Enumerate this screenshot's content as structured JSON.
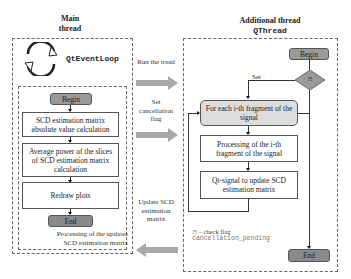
{
  "main_thread": {
    "title_line1": "Main",
    "title_line2": "thread",
    "event_loop_label": "QtEventLoop",
    "begin": "Begin",
    "step1": "SCD estimation matrix absolute value calculation",
    "step2": "Average power of the slices of SCD estimation matrix calculation",
    "step3": "Redraw plots",
    "end": "End",
    "note_line1": "Processing of the updates",
    "note_line2": "SCD estimation matrix"
  },
  "arrows": {
    "run": "Run the tread",
    "cancel": "Set cancellation flag",
    "update": "Update SCD estimation matrix"
  },
  "additional_thread": {
    "title_line1": "Additional thread",
    "title_line2": "QThread",
    "begin": "Begin",
    "decision": "?!",
    "set_label": "Set",
    "loop": "For each i-th fragment of the signal",
    "process": "Processing of the i-th fragment of the signal",
    "signal": "Qt-signal to update SCD estimation matrix",
    "end": "End",
    "legend_line1": "?! – check flag",
    "legend_line2": "cancellation_pending"
  },
  "colors": {
    "pill_fill": "#999999",
    "loop_fill": "#dddddd",
    "arrow_fill": "#a9a9a9"
  }
}
